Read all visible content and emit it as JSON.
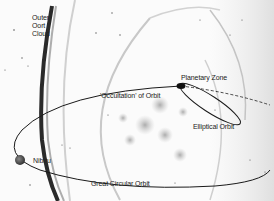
{
  "diagram": {
    "labels": {
      "oort_line1": "Outer",
      "oort_line2": "Oort",
      "oort_line3": "Cloud",
      "planetary_zone": "Planetary Zone",
      "occultation": "'Occultation' of Orbit",
      "elliptical_orbit": "Elliptical Orbit",
      "nibiru": "Nibiru",
      "great_circular_orbit": "Great Circular Orbit"
    },
    "colors": {
      "background": "#fbfbfb",
      "orbit_line": "#1a1a1a",
      "oort_band": "#2a2a2a",
      "haze": "#bdbdbd"
    }
  }
}
